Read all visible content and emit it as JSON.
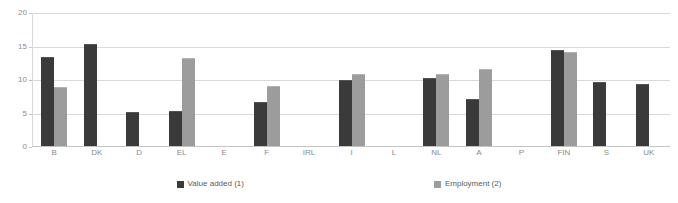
{
  "chart_data": {
    "type": "bar",
    "title": "",
    "subtitle": "",
    "xlabel": "",
    "ylabel": "",
    "ylim": [
      0,
      20
    ],
    "yticks": [
      0,
      5,
      10,
      15,
      20
    ],
    "grid": true,
    "legend_position": "bottom",
    "categories": [
      "B",
      "DK",
      "D",
      "EL",
      "E",
      "F",
      "IRL",
      "I",
      "L",
      "NL",
      "A",
      "P",
      "FIN",
      "S",
      "UK"
    ],
    "series": [
      {
        "name": "Value added (1)",
        "color": "#3a3a3a",
        "values": [
          13.3,
          15.2,
          5.1,
          5.3,
          null,
          6.6,
          null,
          9.9,
          null,
          10.1,
          7.0,
          null,
          14.4,
          9.6,
          9.2
        ]
      },
      {
        "name": "Employment (2)",
        "color": "#9c9c9c",
        "values": [
          8.8,
          null,
          null,
          13.2,
          null,
          8.9,
          null,
          10.8,
          null,
          10.7,
          11.5,
          null,
          14.1,
          null,
          null
        ]
      }
    ]
  },
  "axes": {
    "y_tick_labels": [
      "0",
      "5",
      "10",
      "15",
      "20"
    ],
    "x_tick_labels": [
      "B",
      "DK",
      "D",
      "EL",
      "E",
      "F",
      "IRL",
      "I",
      "L",
      "NL",
      "A",
      "P",
      "FIN",
      "S",
      "UK"
    ]
  },
  "legend": {
    "items": [
      {
        "label": "Value added (1)",
        "color": "#3a3a3a",
        "swatch_name": "legend-swatch-value-added"
      },
      {
        "label": "Employment (2)",
        "color": "#9c9c9c",
        "swatch_name": "legend-swatch-employment"
      }
    ]
  },
  "colors": {
    "value_added": "#3a3a3a",
    "employment": "#9c9c9c",
    "gridline": "#d9d9d9",
    "axis": "#c4c4c4",
    "tick_text": "#8a8a8a",
    "legend_text": "#5a5a5a",
    "background": "#ffffff"
  }
}
